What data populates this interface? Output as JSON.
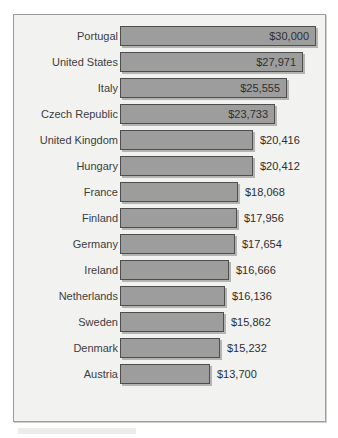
{
  "chart_data": {
    "type": "bar",
    "orientation": "horizontal",
    "title": "",
    "subtitle": "",
    "xlabel": "",
    "ylabel": "",
    "grid": false,
    "legend": null,
    "axis_visible": false,
    "value_prefix": "$",
    "xlim": [
      0,
      30000
    ],
    "categories": [
      "Portugal",
      "United States",
      "Italy",
      "Czech Republic",
      "United Kingdom",
      "Hungary",
      "France",
      "Finland",
      "Germany",
      "Ireland",
      "Netherlands",
      "Sweden",
      "Denmark",
      "Austria"
    ],
    "values": [
      30000,
      27971,
      25555,
      23733,
      20416,
      20412,
      18068,
      17956,
      17654,
      16666,
      16136,
      15862,
      15232,
      13700
    ],
    "value_labels": [
      "$30,000",
      "$27,971",
      "$25,555",
      "$23,733",
      "$20,416",
      "$20,412",
      "$18,068",
      "$17,956",
      "$17,654",
      "$16,666",
      "$16,136",
      "$15,862",
      "$15,232",
      "$13,700"
    ],
    "label_placement": [
      "inside",
      "inside",
      "inside",
      "inside",
      "outside",
      "outside",
      "outside",
      "outside",
      "outside",
      "outside",
      "outside",
      "outside",
      "outside",
      "outside"
    ],
    "colors": {
      "bar_fill": "#9d9d9d",
      "bar_border": "#4e4e4e",
      "panel_background": "#f2f2f0",
      "panel_border": "#9b9b9b",
      "label_text": "#3d3d3d",
      "value_text": "#2f2f2f"
    }
  }
}
